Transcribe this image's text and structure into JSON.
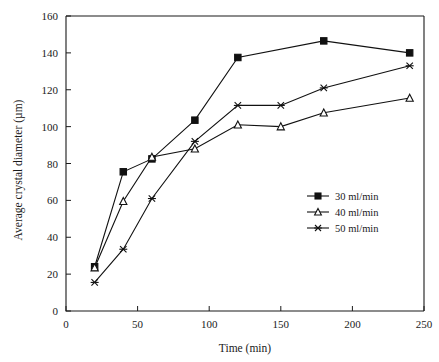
{
  "chart_data": {
    "type": "line",
    "title": "",
    "xlabel": "Time (min)",
    "ylabel": "Average crystal diameter (µm)",
    "xlim": [
      0,
      250
    ],
    "ylim": [
      0,
      160
    ],
    "xticks": [
      0,
      50,
      100,
      150,
      200,
      250
    ],
    "yticks": [
      0,
      20,
      40,
      60,
      80,
      100,
      120,
      140,
      160
    ],
    "xtick_labels": [
      "0",
      "50",
      "100",
      "150",
      "200",
      "250"
    ],
    "ytick_labels": [
      "0",
      "20",
      "40",
      "60",
      "80",
      "100",
      "120",
      "140",
      "160"
    ],
    "grid": false,
    "legend_position": "center-right",
    "x": [
      20,
      40,
      60,
      90,
      120,
      150,
      180,
      240
    ],
    "series": [
      {
        "name": "30 ml/min",
        "marker": "square",
        "values": [
          24,
          75.5,
          82.5,
          103.5,
          137.5,
          null,
          146.5,
          140
        ]
      },
      {
        "name": "40 ml/min",
        "marker": "triangle",
        "values": [
          23.5,
          59.5,
          83.5,
          88,
          101,
          100,
          107.5,
          115.5
        ]
      },
      {
        "name": "50 ml/min",
        "marker": "cross",
        "values": [
          15.5,
          33.5,
          61,
          92,
          111.5,
          111.5,
          121,
          133
        ]
      }
    ]
  },
  "legend": {
    "entries": [
      {
        "label": "30 ml/min",
        "marker": "square"
      },
      {
        "label": "40 ml/min",
        "marker": "triangle"
      },
      {
        "label": "50 ml/min",
        "marker": "cross"
      }
    ]
  },
  "colors": {
    "line": "#111111",
    "axis": "#1a1a1a",
    "background": "#ffffff"
  }
}
